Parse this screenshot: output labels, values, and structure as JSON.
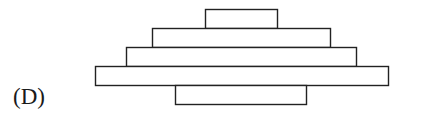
{
  "option_label": "(D)",
  "figure": {
    "stroke_color": "#222222",
    "fill_color": "#ffffff",
    "rects": [
      {
        "name": "top-block",
        "x": 205,
        "y": 9,
        "w": 72,
        "h": 19
      },
      {
        "name": "second-block",
        "x": 152,
        "y": 28,
        "w": 178,
        "h": 19
      },
      {
        "name": "third-block",
        "x": 126,
        "y": 47,
        "w": 230,
        "h": 19
      },
      {
        "name": "widest-block",
        "x": 95,
        "y": 66,
        "w": 293,
        "h": 19
      },
      {
        "name": "bottom-block",
        "x": 175,
        "y": 85,
        "w": 131,
        "h": 19
      }
    ]
  }
}
